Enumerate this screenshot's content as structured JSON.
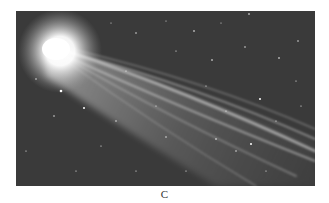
{
  "figure": {
    "caption": "C",
    "colors": {
      "sky": "#3a3a3a",
      "coma": "#ffffff",
      "tail": "#d8d8d8",
      "background": "#ffffff"
    }
  }
}
